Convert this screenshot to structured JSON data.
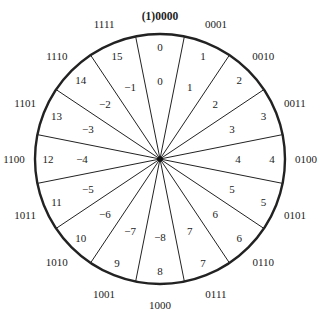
{
  "diagram": {
    "type": "number-wheel",
    "center": [
      160,
      159
    ],
    "radius": 125,
    "colors": {
      "stroke": "#222222",
      "text": "#222222",
      "background": "#ffffff"
    },
    "sectors": [
      {
        "binary": "(1)0000",
        "unsigned": "0",
        "signed": "0"
      },
      {
        "binary": "0001",
        "unsigned": "1",
        "signed": "1"
      },
      {
        "binary": "0010",
        "unsigned": "2",
        "signed": "2"
      },
      {
        "binary": "0011",
        "unsigned": "3",
        "signed": "3"
      },
      {
        "binary": "0100",
        "unsigned": "4",
        "signed": "4"
      },
      {
        "binary": "0101",
        "unsigned": "5",
        "signed": "5"
      },
      {
        "binary": "0110",
        "unsigned": "6",
        "signed": "6"
      },
      {
        "binary": "0111",
        "unsigned": "7",
        "signed": "7"
      },
      {
        "binary": "1000",
        "unsigned": "8",
        "signed": "−8"
      },
      {
        "binary": "1001",
        "unsigned": "9",
        "signed": "−7"
      },
      {
        "binary": "1010",
        "unsigned": "10",
        "signed": "−6"
      },
      {
        "binary": "1011",
        "unsigned": "11",
        "signed": "−5"
      },
      {
        "binary": "1100",
        "unsigned": "12",
        "signed": "−4"
      },
      {
        "binary": "1101",
        "unsigned": "13",
        "signed": "−3"
      },
      {
        "binary": "1110",
        "unsigned": "14",
        "signed": "−2"
      },
      {
        "binary": "1111",
        "unsigned": "15",
        "signed": "−1"
      }
    ]
  }
}
